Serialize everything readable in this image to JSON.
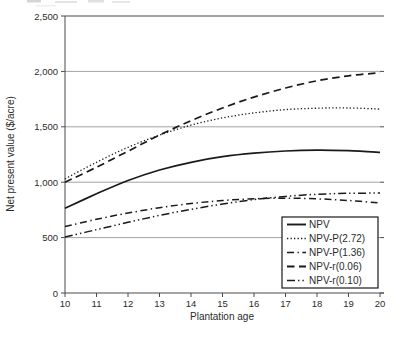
{
  "chart_data": {
    "type": "line",
    "title": "",
    "xlabel": "Plantation age",
    "ylabel": "Net present value ($/acre)",
    "x": [
      10,
      11,
      12,
      13,
      14,
      15,
      16,
      17,
      18,
      19,
      20
    ],
    "xlim": [
      10,
      20
    ],
    "ylim": [
      0,
      2500
    ],
    "yticks": [
      0,
      500,
      1000,
      1500,
      2000,
      2500
    ],
    "ytick_labels": [
      "0",
      "500",
      "1,000",
      "1,500",
      "2,000",
      "2,500"
    ],
    "xtick_labels": [
      "10",
      "11",
      "12",
      "13",
      "14",
      "15",
      "16",
      "17",
      "18",
      "19",
      "20"
    ],
    "grid": "horizontal gridlines at every 500",
    "legend_position": "inside lower-right",
    "series": [
      {
        "name": "NPV",
        "dash": "solid",
        "values": [
          765,
          895,
          1015,
          1110,
          1180,
          1230,
          1262,
          1282,
          1290,
          1285,
          1270
        ]
      },
      {
        "name": "NPV-P(2.72)",
        "dash": "dotted",
        "values": [
          1030,
          1180,
          1315,
          1425,
          1515,
          1580,
          1625,
          1655,
          1668,
          1670,
          1660
        ]
      },
      {
        "name": "NPV-P(1.36)",
        "dash": "dash-dot",
        "values": [
          600,
          665,
          722,
          770,
          808,
          835,
          850,
          856,
          850,
          835,
          812
        ]
      },
      {
        "name": "NPV-r(0.06)",
        "dash": "dashed",
        "values": [
          1000,
          1135,
          1280,
          1425,
          1555,
          1670,
          1768,
          1850,
          1915,
          1960,
          1988
        ]
      },
      {
        "name": "NPV-r(0.10)",
        "dash": "dash-dot-dot",
        "values": [
          505,
          572,
          638,
          700,
          755,
          803,
          843,
          872,
          891,
          900,
          902
        ]
      }
    ],
    "colors": {
      "line": "#1a1a1a",
      "grid": "#8c8c8c",
      "axis": "#4a4a4a",
      "text": "#2b2b2b",
      "background": "#ffffff"
    }
  }
}
